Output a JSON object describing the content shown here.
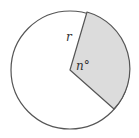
{
  "diagram": {
    "type": "circle-sector",
    "labels": {
      "radius": "r",
      "angle": "n°"
    },
    "circle": {
      "cx": 70,
      "cy": 70,
      "r": 59,
      "stroke": "#555555",
      "fill": "#ffffff"
    },
    "sector": {
      "fill": "#dcdcdc",
      "stroke": "#555555",
      "vertex": [
        70,
        70
      ],
      "start_point": [
        87,
        12
      ],
      "end_point": [
        114,
        109
      ]
    }
  }
}
